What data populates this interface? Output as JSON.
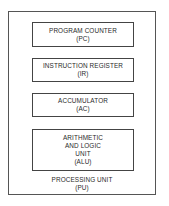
{
  "diagram": {
    "type": "block-diagram",
    "container": {
      "title": "PROCESSING UNIT",
      "abbrev": "(PU)"
    },
    "components": [
      {
        "lines": [
          "PROGRAM COUNTER",
          "(PC)"
        ]
      },
      {
        "lines": [
          "INSTRUCTION REGISTER",
          "(IR)"
        ]
      },
      {
        "lines": [
          "ACCUMULATOR",
          "(AC)"
        ]
      },
      {
        "lines": [
          "ARITHMETIC",
          "AND LOGIC",
          "UNIT",
          "(ALU)"
        ]
      }
    ]
  }
}
